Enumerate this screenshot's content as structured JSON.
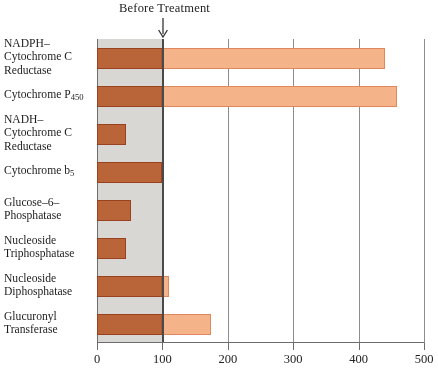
{
  "chart_data": {
    "type": "bar",
    "orientation": "horizontal",
    "title": "Before Treatment",
    "xlabel": "",
    "ylabel": "",
    "xlim": [
      0,
      500
    ],
    "xticks": [
      0,
      100,
      200,
      300,
      400,
      500
    ],
    "xticklabels": [
      "0",
      "100",
      "200",
      "300",
      "400",
      "500"
    ],
    "grid": true,
    "legend": null,
    "annotations": [
      {
        "text": "Before Treatment",
        "points_to": 100,
        "marker": "down-arrow"
      }
    ],
    "reference_band": {
      "from": 0,
      "to": 100,
      "color": "#d2d0cc",
      "label": "baseline (before treatment) = 100"
    },
    "categories": [
      "NADPH–\nCytochrome C\nReductase",
      "Cytochrome P450",
      "NADH–\nCytochrome C\nReductase",
      "Cytochrome b5",
      "Glucose–6–\nPhosphatase",
      "Nucleoside\nTriphosphatase",
      "Nucleoside\nDiphosphatase",
      "Glucuronyl\nTransferase"
    ],
    "values": [
      440,
      458,
      45,
      100,
      52,
      45,
      110,
      175
    ],
    "colors": {
      "bar": "#f4b388",
      "bar_border": "#e0875b",
      "overlay": "#c28f6b",
      "band": "#d2d0cc",
      "axis": "#6d6d6d"
    }
  },
  "labels": [
    {
      "lines": [
        "NADPH–",
        "Cytochrome C",
        "Reductase"
      ],
      "sub": null
    },
    {
      "lines": [
        "Cytochrome P"
      ],
      "sub": "450"
    },
    {
      "lines": [
        "NADH–",
        "Cytochrome C",
        "Reductase"
      ],
      "sub": null
    },
    {
      "lines": [
        "Cytochrome b"
      ],
      "sub": "5"
    },
    {
      "lines": [
        "Glucose–6–",
        "Phosphatase"
      ],
      "sub": null
    },
    {
      "lines": [
        "Nucleoside",
        "Triphosphatase"
      ],
      "sub": null
    },
    {
      "lines": [
        "Nucleoside",
        "Diphosphatase"
      ],
      "sub": null
    },
    {
      "lines": [
        "Glucuronyl",
        "Transferase"
      ],
      "sub": null
    }
  ]
}
